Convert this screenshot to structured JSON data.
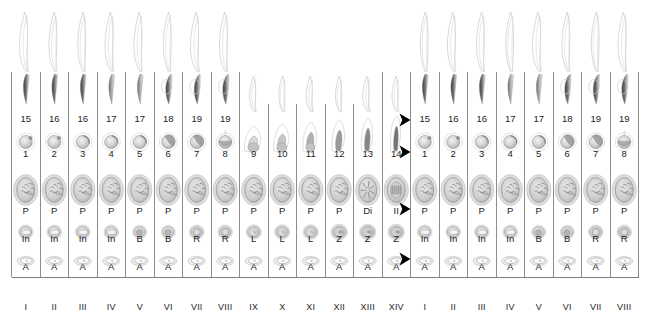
{
  "figure": {
    "grid": {
      "left": 11.5,
      "right": 638.5,
      "top": 72.0,
      "bottom": 296.0,
      "column_count": 22,
      "column_width": 28.5,
      "row_boundaries": [
        72,
        132,
        164,
        221,
        249,
        277,
        296
      ],
      "line_color": "#6f6f6f"
    },
    "stage_labels": [
      "I",
      "II",
      "III",
      "IV",
      "V",
      "VI",
      "VII",
      "VIII",
      "IX",
      "X",
      "XI",
      "XII",
      "XIII",
      "XIV",
      "I",
      "II",
      "III",
      "IV",
      "V",
      "VI",
      "VII",
      "VIII"
    ],
    "rows": [
      {
        "name": "late-spermatid-row",
        "description": "Late elongated spermatids, steps 15-19",
        "label_y": 122,
        "cells": [
          "15",
          "16",
          "16",
          "17",
          "17",
          "18",
          "19",
          "19",
          "",
          "",
          "",
          "",
          "",
          "",
          "15",
          "16",
          "16",
          "17",
          "17",
          "18",
          "19",
          "19"
        ]
      },
      {
        "name": "early-spermatid-row",
        "description": "Round and elongating spermatids, steps 1-14",
        "label_y": 157,
        "cells": [
          "1",
          "2",
          "3",
          "4",
          "5",
          "6",
          "7",
          "8",
          "9",
          "10",
          "11",
          "12",
          "13",
          "14",
          "1",
          "2",
          "3",
          "4",
          "5",
          "6",
          "7",
          "8"
        ]
      },
      {
        "name": "spermatocyte-row",
        "description": "Primary spermatocytes: pachytene, diplotene, meiotic division",
        "label_y": 214,
        "cells": [
          "P",
          "P",
          "P",
          "P",
          "P",
          "P",
          "P",
          "P",
          "P",
          "P",
          "P",
          "P",
          "Di",
          "II",
          "P",
          "P",
          "P",
          "P",
          "P",
          "P",
          "P",
          "P"
        ]
      },
      {
        "name": "young-spermatocyte-row",
        "description": "Intermediate, B spermatogonia, resting, leptotene, zygotene",
        "label_y": 242,
        "cells": [
          "In",
          "In",
          "In",
          "In",
          "B",
          "B",
          "R",
          "R",
          "L",
          "L",
          "L",
          "Z",
          "Z",
          "Z",
          "In",
          "In",
          "In",
          "In",
          "B",
          "B",
          "R",
          "R"
        ]
      },
      {
        "name": "spermatogonia-row",
        "description": "Type A spermatogonia",
        "label_y": 270,
        "cells": [
          "A",
          "A",
          "A",
          "A",
          "A",
          "A",
          "A",
          "A",
          "A",
          "A",
          "A",
          "A",
          "A",
          "A",
          "A",
          "A",
          "A",
          "A",
          "A",
          "A",
          "A",
          "A"
        ]
      }
    ],
    "arrows": {
      "name": "cycle-continuation-arrows",
      "color": "#000000",
      "x": 408.5,
      "y_positions": [
        120,
        152,
        209,
        259
      ],
      "count": 4,
      "direction": "right"
    }
  }
}
